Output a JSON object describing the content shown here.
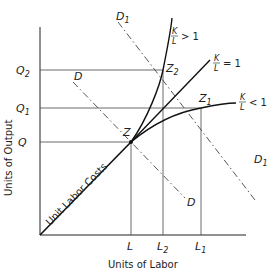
{
  "diagram": {
    "x_axis_title": "Units of Labor",
    "y_axis_title": "Units of Output",
    "diagonal_label": "Unit Labor Costs",
    "x_ticks": [
      {
        "name": "L",
        "sub": ""
      },
      {
        "name": "L",
        "sub": "2"
      },
      {
        "name": "L",
        "sub": "1"
      }
    ],
    "y_ticks": [
      {
        "name": "Q",
        "sub": "2"
      },
      {
        "name": "Q",
        "sub": "1"
      },
      {
        "name": "Q",
        "sub": ""
      }
    ],
    "points": [
      {
        "name": "Z",
        "sub": ""
      },
      {
        "name": "Z",
        "sub": "2"
      },
      {
        "name": "Z",
        "sub": "1"
      }
    ],
    "curves": [
      {
        "ratio_num": "K",
        "ratio_den": "L",
        "relation": "> 1"
      },
      {
        "ratio_num": "K",
        "ratio_den": "L",
        "relation": "= 1"
      },
      {
        "ratio_num": "K",
        "ratio_den": "L",
        "relation": "< 1"
      }
    ],
    "demand_lines": [
      {
        "name": "D",
        "sub": "1"
      },
      {
        "name": "D",
        "sub": ""
      }
    ]
  }
}
